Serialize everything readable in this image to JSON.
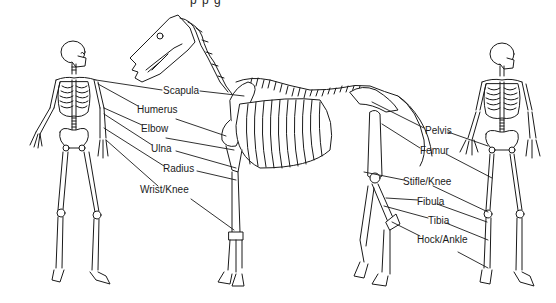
{
  "diagram": {
    "title_fragment": "p          p          g",
    "colors": {
      "line": "#1a1a1a",
      "bone_fill": "#ffffff",
      "background": "#ffffff"
    },
    "figures": [
      {
        "id": "human-left",
        "description": "Human skeleton, front view"
      },
      {
        "id": "horse",
        "description": "Horse skeleton, side view"
      },
      {
        "id": "human-right",
        "description": "Human skeleton, front view"
      }
    ],
    "labels_left": [
      {
        "text": "Scapula",
        "x": 163,
        "y": 86
      },
      {
        "text": "Humerus",
        "x": 137,
        "y": 105
      },
      {
        "text": "Elbow",
        "x": 141,
        "y": 124
      },
      {
        "text": "Ulna",
        "x": 151,
        "y": 144
      },
      {
        "text": "Radius",
        "x": 163,
        "y": 164
      },
      {
        "text": "Wrist/Knee",
        "x": 140,
        "y": 185
      }
    ],
    "labels_right": [
      {
        "text": "Pelvis",
        "x": 425,
        "y": 126
      },
      {
        "text": "Femur",
        "x": 420,
        "y": 146
      },
      {
        "text": "Stifle/Knee",
        "x": 403,
        "y": 177
      },
      {
        "text": "Fibula",
        "x": 417,
        "y": 197
      },
      {
        "text": "Tibia",
        "x": 428,
        "y": 216
      },
      {
        "text": "Hock/Ankle",
        "x": 417,
        "y": 235
      }
    ]
  }
}
